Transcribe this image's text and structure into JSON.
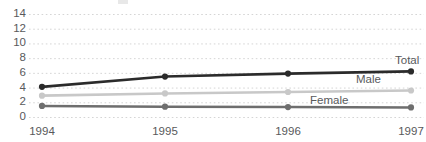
{
  "chart_data": {
    "type": "line",
    "title": "",
    "subtitle": "",
    "xlabel": "",
    "ylabel": "",
    "x": [
      "1994",
      "1995",
      "1996",
      "1997"
    ],
    "categories": [
      "1994",
      "1995",
      "1996",
      "1997"
    ],
    "ylim": [
      0,
      14
    ],
    "yticks": [
      0,
      2,
      4,
      6,
      8,
      10,
      12,
      14
    ],
    "ytick_labels": [
      "0",
      "2",
      "4",
      "6",
      "8",
      "10",
      "12",
      "14"
    ],
    "xtick_labels": [
      "1994",
      "1995",
      "1996",
      "1997"
    ],
    "grid": true,
    "grid_style": "dotted",
    "grid_color": "#d5d5d5",
    "legend_position": "line-end-labels",
    "markers": "circle",
    "series": [
      {
        "name": "Total",
        "label": "Total",
        "color": "#2b2b2b",
        "values": [
          4.1,
          5.5,
          5.9,
          6.2
        ]
      },
      {
        "name": "Male",
        "label": "Male",
        "color": "#c8c8c8",
        "values": [
          2.9,
          3.2,
          3.4,
          3.6
        ]
      },
      {
        "name": "Female",
        "label": "Female",
        "color": "#6e6e6e",
        "values": [
          1.5,
          1.4,
          1.35,
          1.3
        ]
      }
    ]
  },
  "axis": {
    "y_labels": [
      "14",
      "12",
      "10",
      "8",
      "6",
      "4",
      "2",
      "0"
    ],
    "x_labels": [
      "1994",
      "1995",
      "1996",
      "1997"
    ]
  },
  "labels": {
    "total": "Total",
    "male": "Male",
    "female": "Female"
  },
  "colors": {
    "total": "#2b2b2b",
    "male": "#c8c8c8",
    "female": "#6e6e6e",
    "grid": "#d5d5d5",
    "text": "#58595b",
    "background": "#ffffff"
  }
}
